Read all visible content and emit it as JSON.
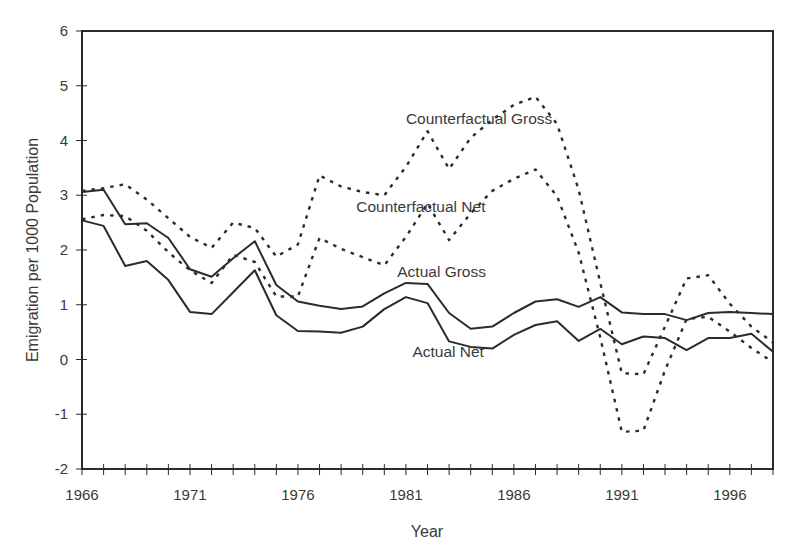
{
  "chart_data": {
    "type": "line",
    "title": "",
    "xlabel": "Year",
    "ylabel": "Emigration per 1000 Population",
    "xlim": [
      1966,
      1998
    ],
    "ylim": [
      -2,
      6
    ],
    "grid": false,
    "legend": "inline labels",
    "x_tick_labels": [
      "1966",
      "1971",
      "1976",
      "1981",
      "1986",
      "1991",
      "1996"
    ],
    "y_tick_labels": [
      "-2",
      "-1",
      "0",
      "1",
      "2",
      "3",
      "4",
      "5",
      "6"
    ],
    "x": [
      1966,
      1967,
      1968,
      1969,
      1970,
      1971,
      1972,
      1973,
      1974,
      1975,
      1976,
      1977,
      1978,
      1979,
      1980,
      1981,
      1982,
      1983,
      1984,
      1985,
      1986,
      1987,
      1988,
      1989,
      1990,
      1991,
      1992,
      1993,
      1994,
      1995,
      1996,
      1997,
      1998
    ],
    "series": [
      {
        "name": "Actual Gross",
        "style": "solid",
        "values": [
          3.06,
          3.1,
          2.47,
          2.49,
          2.22,
          1.65,
          1.51,
          1.85,
          2.16,
          1.36,
          1.06,
          0.98,
          0.92,
          0.97,
          1.21,
          1.4,
          1.38,
          0.85,
          0.56,
          0.6,
          0.85,
          1.06,
          1.1,
          0.96,
          1.14,
          0.86,
          0.83,
          0.83,
          0.72,
          0.85,
          0.87,
          0.85,
          0.83
        ]
      },
      {
        "name": "Actual Net",
        "style": "solid",
        "values": [
          2.54,
          2.44,
          1.71,
          1.8,
          1.45,
          0.87,
          0.83,
          1.23,
          1.63,
          0.81,
          0.52,
          0.51,
          0.49,
          0.6,
          0.92,
          1.14,
          1.03,
          0.33,
          0.23,
          0.2,
          0.45,
          0.63,
          0.7,
          0.34,
          0.56,
          0.28,
          0.42,
          0.39,
          0.17,
          0.39,
          0.39,
          0.47,
          0.14
        ]
      },
      {
        "name": "Counterfactual Gross",
        "style": "dashed",
        "values": [
          3.08,
          3.13,
          3.2,
          2.92,
          2.58,
          2.24,
          2.04,
          2.5,
          2.4,
          1.88,
          2.1,
          3.36,
          3.16,
          3.06,
          3.0,
          3.52,
          4.17,
          3.48,
          4.05,
          4.38,
          4.65,
          4.8,
          4.3,
          3.1,
          1.4,
          -0.25,
          -0.27,
          0.6,
          1.48,
          1.54,
          1.02,
          0.6,
          0.31
        ]
      },
      {
        "name": "Counterfactual Net",
        "style": "dashed",
        "values": [
          2.56,
          2.64,
          2.62,
          2.35,
          1.96,
          1.63,
          1.4,
          1.91,
          1.78,
          1.15,
          1.15,
          2.22,
          2.02,
          1.87,
          1.72,
          2.24,
          2.85,
          2.18,
          2.67,
          3.08,
          3.3,
          3.47,
          2.98,
          1.95,
          0.4,
          -1.32,
          -1.3,
          -0.2,
          0.74,
          0.78,
          0.51,
          0.21,
          -0.05
        ]
      }
    ],
    "annotations": [
      {
        "text": "Counterfactual Gross",
        "x": 1981.0,
        "y": 4.3
      },
      {
        "text": "Counterfactual Net",
        "x": 1978.7,
        "y": 2.7
      },
      {
        "text": "Actual Gross",
        "x": 1980.6,
        "y": 1.5
      },
      {
        "text": "Actual Net",
        "x": 1981.3,
        "y": 0.05
      }
    ]
  },
  "colors": {
    "line": "#2b2b2b",
    "axis": "#2b2b2b",
    "text": "#3a3a3a",
    "background": "#ffffff"
  }
}
